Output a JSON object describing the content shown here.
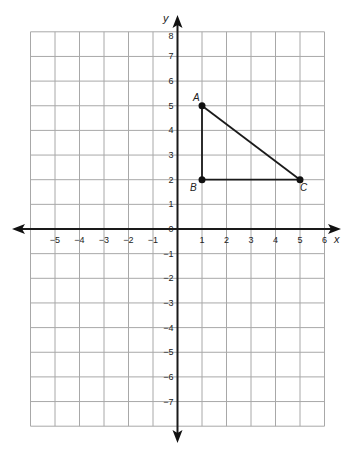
{
  "diagram": {
    "type": "coordinate-plane",
    "x_axis": {
      "label": "x",
      "min": -6,
      "max": 6,
      "tick_labels": [
        "-5",
        "-4",
        "-3",
        "-2",
        "-1",
        "1",
        "2",
        "3",
        "4",
        "5",
        "6"
      ]
    },
    "y_axis": {
      "label": "y",
      "min": -8,
      "max": 8,
      "tick_labels": [
        "8",
        "7",
        "6",
        "5",
        "4",
        "3",
        "2",
        "1",
        "0",
        "-1",
        "-2",
        "-3",
        "-4",
        "-5",
        "-6",
        "-7"
      ]
    },
    "origin_label": "0",
    "points": [
      {
        "name": "A",
        "x": 1,
        "y": 5
      },
      {
        "name": "B",
        "x": 1,
        "y": 2
      },
      {
        "name": "C",
        "x": 5,
        "y": 2
      }
    ],
    "segments": [
      [
        "A",
        "B"
      ],
      [
        "B",
        "C"
      ],
      [
        "A",
        "C"
      ]
    ],
    "colors": {
      "grid": "#a8a8a8",
      "axis": "#1a1a1a",
      "shape": "#1a1a1a"
    }
  }
}
